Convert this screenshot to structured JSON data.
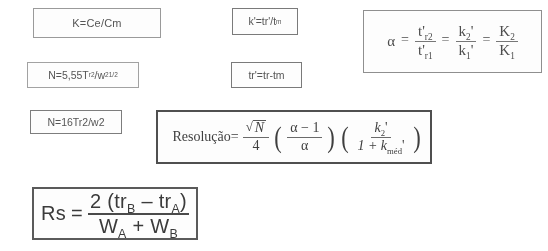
{
  "page": {
    "background_color": "#ffffff",
    "text_color": "#4a4a4a"
  },
  "formulas": [
    {
      "id": "partition-coefficient",
      "name": "partition-coefficient-box",
      "text": "K=Ce/Cm",
      "parts": {
        "lhs": "K",
        "eq": "=",
        "rhs": "Ce/Cm"
      }
    },
    {
      "id": "plate-number-width-half",
      "name": "plate-number-half-width-box",
      "text": "N=5,55Tr²/w²1/2",
      "parts": {
        "lead": "N=5,55T",
        "lead_sub": "r",
        "lead_sup": "2",
        "slash": "/w",
        "tail_sup": "2",
        "tail_sub": "1/2"
      }
    },
    {
      "id": "plate-number-base-width",
      "name": "plate-number-base-width-box",
      "text": "N=16Tr2/w2"
    },
    {
      "id": "capacity-factor",
      "name": "capacity-factor-box",
      "text": "k'=tr'/tm",
      "parts": {
        "lead": "k'=tr'/t",
        "sub": "m"
      }
    },
    {
      "id": "adjusted-retention-time",
      "name": "adjusted-retention-time-box",
      "text": "tr'=tr-tm"
    },
    {
      "id": "selectivity-factor",
      "name": "selectivity-factor-box",
      "text": "α = t'r2 / t'r1 = k2' / k1' = K2 / K1",
      "parts": {
        "alpha": "α",
        "equals1": "=",
        "equals2": "=",
        "equals3": "=",
        "frac1_num_base": "t'",
        "frac1_num_sub": "r2",
        "frac1_den_base": "t'",
        "frac1_den_sub": "r1",
        "frac2_num_base": "k",
        "frac2_num_sub": "2",
        "frac2_num_prime": "'",
        "frac2_den_base": "k",
        "frac2_den_sub": "1",
        "frac2_den_prime": "'",
        "frac3_num_base": "K",
        "frac3_num_sub": "2",
        "frac3_den_base": "K",
        "frac3_den_sub": "1"
      }
    },
    {
      "id": "resolution-master",
      "name": "resolution-formula-box",
      "text": "Resolução= (√N/4)((α-1)/α)(k2'/(1+kméd))",
      "parts": {
        "label": "Resolução=",
        "sqrt_sign": "√",
        "radicand": "N",
        "den_four": "4",
        "open_paren_1": "(",
        "close_paren_1": ")",
        "open_paren_2": "(",
        "close_paren_2": ")",
        "alpha_minus_one": "α − 1",
        "alpha": "α",
        "k2_base": "k",
        "k2_sub": "2",
        "k2_prime": "'",
        "one_plus": "1 + k",
        "kmed_sub": "méd",
        "kmed_prime": "'"
      }
    },
    {
      "id": "resolution-peaks",
      "name": "resolution-peaks-box",
      "text": "Rs = 2 (trB - trA) / (WA + WB)",
      "parts": {
        "lhs": "Rs",
        "eq": "=",
        "num_lead": "2 (tr",
        "num_sub_b": "B",
        "num_minus": " – tr",
        "num_sub_a": "A",
        "num_close": ")",
        "den_wa": "W",
        "den_wa_sub": "A",
        "den_plus": " + W",
        "den_wb_sub": "B"
      }
    }
  ]
}
